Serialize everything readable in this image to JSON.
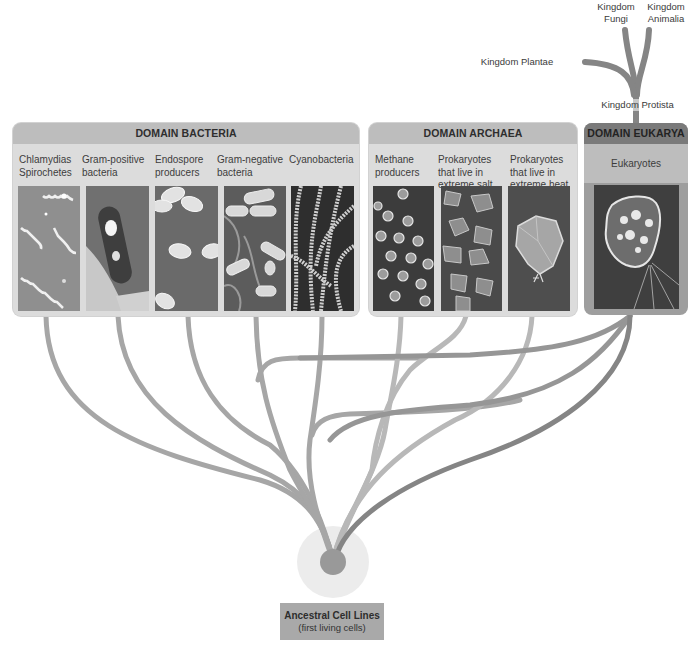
{
  "diagram": {
    "kingdoms": {
      "fungi": "Kingdom\nFungi",
      "fungi_line1": "Kingdom",
      "fungi_line2": "Fungi",
      "animalia_line1": "Kingdom",
      "animalia_line2": "Animalia",
      "plantae": "Kingdom Plantae",
      "protista": "Kingdom Protista"
    },
    "domains": [
      {
        "title": "DOMAIN BACTERIA",
        "groups": [
          {
            "line1": "Chlamydias",
            "line2": "Spirochetes",
            "line3": ""
          },
          {
            "line1": "Gram-positive",
            "line2": "bacteria",
            "line3": ""
          },
          {
            "line1": "Endospore",
            "line2": "producers",
            "line3": ""
          },
          {
            "line1": "Gram-negative",
            "line2": "bacteria",
            "line3": ""
          },
          {
            "line1": "Cyanobacteria",
            "line2": "",
            "line3": ""
          }
        ]
      },
      {
        "title": "DOMAIN ARCHAEA",
        "groups": [
          {
            "line1": "Methane",
            "line2": "producers",
            "line3": ""
          },
          {
            "line1": "Prokaryotes",
            "line2": "that live in",
            "line3": "extreme salt"
          },
          {
            "line1": "Prokaryotes",
            "line2": "that live in",
            "line3": "extreme heat"
          }
        ]
      },
      {
        "title": "DOMAIN EUKARYA",
        "groups": [
          {
            "line1": "Eukaryotes",
            "line2": "",
            "line3": ""
          }
        ]
      }
    ],
    "root": {
      "title": "Ancestral Cell Lines",
      "subtitle": "(first living cells)"
    },
    "colors": {
      "bacteria_branch": "#a3a3a3",
      "archaea_branch": "#b5b5b5",
      "eukarya_branch": "#8a8a8a",
      "box_bg": "#dcdcdc",
      "header_bg": "#bdbdbd",
      "eukarya_header": "#7a7a7a",
      "root_halo": "#ececec",
      "root_core": "#999999"
    }
  }
}
